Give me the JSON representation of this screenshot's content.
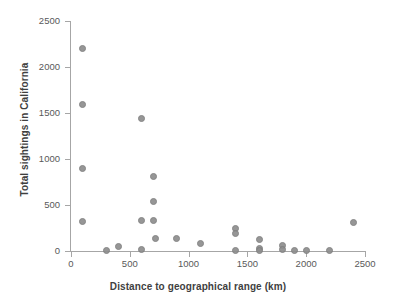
{
  "figure": {
    "top_clipped_text": "",
    "background_color": "#ffffff",
    "marker_color": "#8e8e8e",
    "axis_color": "#a6a6a6",
    "tick_label_color": "#595959",
    "axis_title_color": "#3f3f3f"
  },
  "chart_data": {
    "type": "scatter",
    "title": "",
    "subtitle": "",
    "xlabel": "Distance to geographical range (km)",
    "ylabel": "Total sightings in California",
    "xlim": [
      0,
      2500
    ],
    "ylim": [
      0,
      2500
    ],
    "xticks": [
      0,
      500,
      1000,
      1500,
      2000,
      2500
    ],
    "yticks": [
      0,
      500,
      1000,
      1500,
      2000,
      2500
    ],
    "xtick_labels": [
      "0",
      "500",
      "1000",
      "1500",
      "2000",
      "2500"
    ],
    "ytick_labels": [
      "0",
      "500",
      "1000",
      "1500",
      "2000",
      "2500"
    ],
    "grid": false,
    "legend": false,
    "legend_position": "none",
    "annotations": [],
    "series": [
      {
        "name": "Species",
        "marker": "circle",
        "color": "#8e8e8e",
        "points": [
          {
            "x": 100,
            "y": 2205
          },
          {
            "x": 100,
            "y": 1590
          },
          {
            "x": 100,
            "y": 900
          },
          {
            "x": 100,
            "y": 325
          },
          {
            "x": 300,
            "y": 10
          },
          {
            "x": 400,
            "y": 45
          },
          {
            "x": 600,
            "y": 1440
          },
          {
            "x": 600,
            "y": 330
          },
          {
            "x": 600,
            "y": 15
          },
          {
            "x": 700,
            "y": 810
          },
          {
            "x": 700,
            "y": 540
          },
          {
            "x": 700,
            "y": 330
          },
          {
            "x": 720,
            "y": 135
          },
          {
            "x": 900,
            "y": 135
          },
          {
            "x": 1100,
            "y": 80
          },
          {
            "x": 1400,
            "y": 245
          },
          {
            "x": 1400,
            "y": 195
          },
          {
            "x": 1400,
            "y": 10
          },
          {
            "x": 1600,
            "y": 120
          },
          {
            "x": 1600,
            "y": 30
          },
          {
            "x": 1600,
            "y": 5
          },
          {
            "x": 1800,
            "y": 65
          },
          {
            "x": 1800,
            "y": 20
          },
          {
            "x": 1900,
            "y": 5
          },
          {
            "x": 2000,
            "y": 5
          },
          {
            "x": 2200,
            "y": 10
          },
          {
            "x": 2400,
            "y": 305
          }
        ]
      }
    ]
  }
}
